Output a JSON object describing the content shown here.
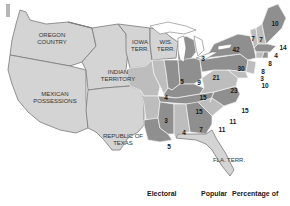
{
  "territories": {
    "oregon": "OREGON COUNTRY",
    "indian": "INDIAN TERRITORY",
    "iowa": "IOWA TERR.",
    "wis": "WIS. TERR.",
    "mexican": "MEXICAN POSSESSIONS",
    "texas": "REPUBLIC OF TEXAS",
    "fla": "FLA. TERR."
  },
  "territory_lines": {
    "oregon": [
      "OREGON",
      "COUNTRY"
    ],
    "indian": [
      "INDIAN",
      "TERRITORY"
    ],
    "iowa": [
      "IOWA",
      "TERR."
    ],
    "wis": [
      "WIS.",
      "TERR."
    ],
    "mexican": [
      "MEXICAN",
      "POSSESSIONS"
    ],
    "texas": [
      "REPUBLIC OF",
      "TEXAS"
    ],
    "fla": [
      "FLA. TERR."
    ]
  },
  "electoral_votes": {
    "maine": "10",
    "vermont": "7",
    "new_hampshire": "7",
    "massachusetts": "14",
    "rhode_island": "4",
    "connecticut": "8",
    "new_jersey": "8",
    "delaware": "3",
    "maryland": "10",
    "new_york": "42",
    "pennsylvania": "30",
    "virginia": "23",
    "north_carolina": "15",
    "south_carolina": "11",
    "georgia": "11",
    "alabama": "7",
    "mississippi": "4",
    "louisiana": "5",
    "arkansas": "3",
    "tennessee": "15",
    "kentucky": "15",
    "ohio": "21",
    "indiana": "9",
    "illinois": "5",
    "missouri": "4",
    "michigan": "3"
  },
  "legend": {
    "col1": "Electoral",
    "col2": "Popular",
    "col3": "Percentage of"
  },
  "colors": {
    "territory": "#d4d4d4",
    "light_state": "#bdbdbd",
    "dark_state": "#8f8f8f",
    "border": "#7a7a7a"
  }
}
